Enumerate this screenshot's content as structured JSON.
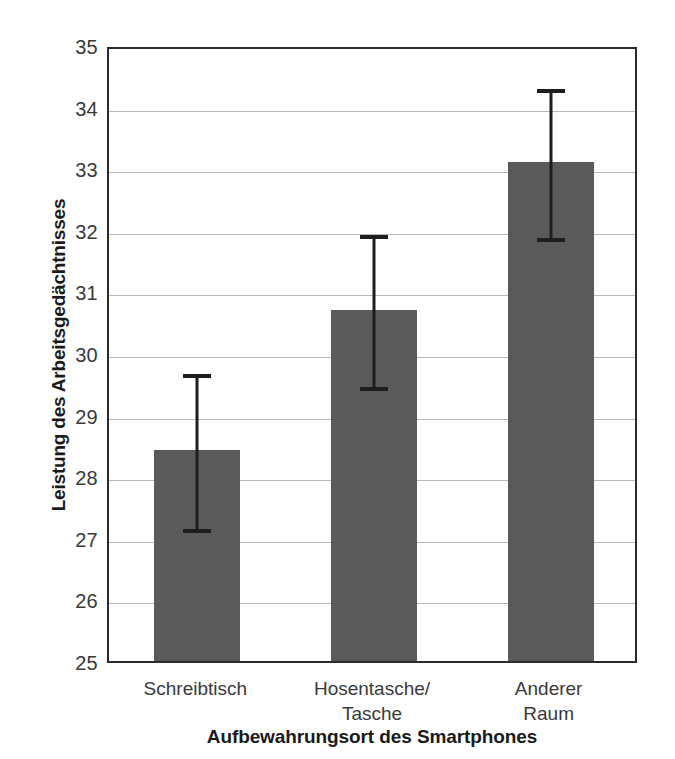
{
  "chart_data": {
    "type": "bar",
    "title": "",
    "subtitle": "",
    "xlabel": "Aufbewahrungsort des Smartphones",
    "ylabel": "Leistung des Arbeitsgedächtnisses",
    "categories": [
      "Schreibtisch",
      "Hosentasche/\nTasche",
      "Anderer Raum"
    ],
    "values": [
      28.42,
      30.7,
      33.1
    ],
    "error_upper": [
      29.69,
      31.95,
      34.32
    ],
    "error_lower": [
      27.18,
      29.48,
      31.9
    ],
    "ylim": [
      25,
      35
    ],
    "yticks": [
      25,
      26,
      27,
      28,
      29,
      30,
      31,
      32,
      33,
      34,
      35
    ],
    "ytick_labels": [
      "25",
      "26",
      "27",
      "28",
      "29",
      "30",
      "31",
      "32",
      "33",
      "34",
      "35"
    ],
    "grid": true,
    "grid_axis": "y",
    "legend": false,
    "legend_position": "none",
    "bar_color": "#5a5a5a",
    "errorbar_color": "#1e1e1e",
    "gridline_color": "#b9b9b9",
    "axis_color": "#2b2b2b",
    "background_color": "#ffffff",
    "annotations": []
  }
}
